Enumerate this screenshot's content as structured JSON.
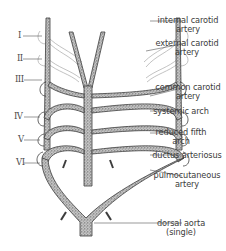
{
  "figure": {
    "arch_numerals": [
      "I",
      "II",
      "III",
      "IV",
      "V",
      "VI"
    ],
    "labels": [
      {
        "id": "internal_carotid",
        "line1": "internal carotid",
        "line2": "artery"
      },
      {
        "id": "external_carotid",
        "line1": "external carotid",
        "line2": "artery"
      },
      {
        "id": "common_carotid",
        "line1": "common carotid",
        "line2": "artery"
      },
      {
        "id": "systemic_arch",
        "line1": "systemic arch",
        "line2": ""
      },
      {
        "id": "reduced_fifth",
        "line1": "reduced fifth",
        "line2": "arch"
      },
      {
        "id": "ductus",
        "line1": "ductus arteriosus",
        "line2": ""
      },
      {
        "id": "pulmocutaneous",
        "line1": "pulmocutaneous",
        "line2": "artery"
      },
      {
        "id": "dorsal_aorta",
        "line1": "dorsal aorta",
        "line2": "(single)"
      }
    ]
  },
  "colors": {
    "vessel_fill": "#b9b9b9",
    "vessel_stroke": "#3d3d3d",
    "faded_vessel": "#c8c8c8",
    "leader_line": "#555555",
    "text": "#3c3c3c"
  }
}
